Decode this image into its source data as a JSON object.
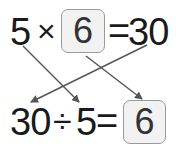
{
  "equation1": {
    "left": "5",
    "operator": "×",
    "box_value": "6",
    "equals": "=",
    "result": "30"
  },
  "equation2": {
    "left": "30",
    "operator": "÷",
    "right": "5",
    "equals": "=",
    "box_value": "6"
  },
  "arrows": [
    {
      "from": "5 (top)",
      "to": "5 (bottom)"
    },
    {
      "from": "30 (top)",
      "to": "30 (bottom)"
    },
    {
      "from": "6 box (top)",
      "to": "6 box (bottom)"
    }
  ],
  "colors": {
    "text": "#1a1a1a",
    "box_border": "#9a9a9a",
    "box_fill": "#f2f2f2",
    "arrow": "#555555"
  }
}
